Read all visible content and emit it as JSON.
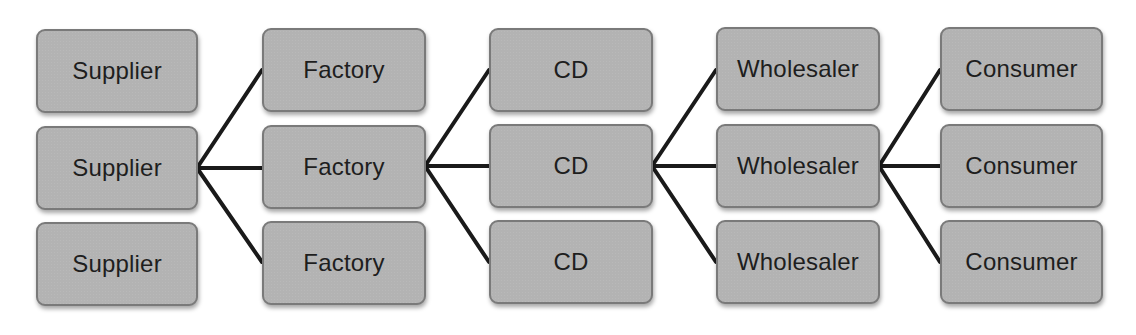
{
  "diagram": {
    "type": "supply-chain-network",
    "colors": {
      "node_fill": "#b3b3b3",
      "node_border": "#7a7a7a",
      "text": "#1e1e1e",
      "connector": "#1a1a1a",
      "background": "#ffffff"
    },
    "columns": [
      {
        "name": "Supplier",
        "nodes": [
          "Supplier",
          "Supplier",
          "Supplier"
        ]
      },
      {
        "name": "Factory",
        "nodes": [
          "Factory",
          "Factory",
          "Factory"
        ]
      },
      {
        "name": "CD",
        "nodes": [
          "CD",
          "CD",
          "CD"
        ]
      },
      {
        "name": "Wholesaler",
        "nodes": [
          "Wholesaler",
          "Wholesaler",
          "Wholesaler"
        ]
      },
      {
        "name": "Consumer",
        "nodes": [
          "Consumer",
          "Consumer",
          "Consumer"
        ]
      }
    ],
    "edges": [
      {
        "from": "Supplier (middle)",
        "to": [
          "Factory (top)",
          "Factory (middle)",
          "Factory (bottom)"
        ]
      },
      {
        "from": "Factory (middle)",
        "to": [
          "CD (top)",
          "CD (middle)",
          "CD (bottom)"
        ]
      },
      {
        "from": "CD (middle)",
        "to": [
          "Wholesaler (top)",
          "Wholesaler (middle)",
          "Wholesaler (bottom)"
        ]
      },
      {
        "from": "Wholesaler (middle)",
        "to": [
          "Consumer (top)",
          "Consumer (middle)",
          "Consumer (bottom)"
        ]
      }
    ]
  }
}
